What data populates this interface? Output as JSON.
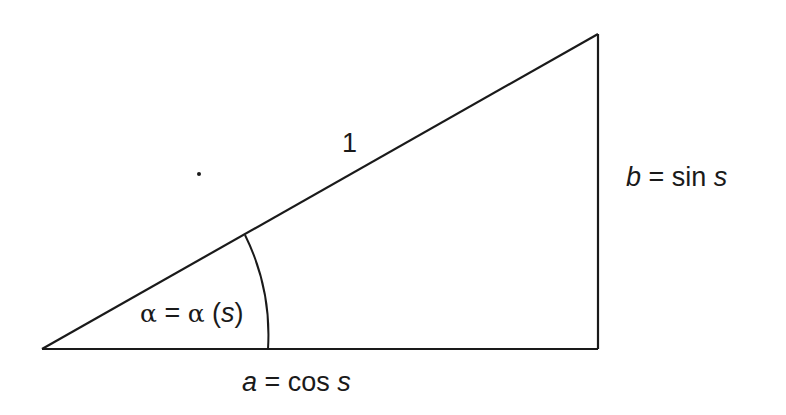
{
  "diagram": {
    "type": "right-triangle",
    "stroke_color": "#1a1a1a",
    "background": "#ffffff",
    "vertices": {
      "origin": [
        42,
        349
      ],
      "right_angle": [
        598,
        349
      ],
      "apex": [
        598,
        34
      ]
    },
    "angle_arc": {
      "center": [
        42,
        349
      ],
      "radius": 226
    },
    "dot": [
      199,
      174
    ],
    "labels": {
      "hypotenuse": {
        "text": "1"
      },
      "vertical": {
        "var": "b",
        "eq": " = sin ",
        "arg": "s"
      },
      "base": {
        "var": "a",
        "eq": " = cos ",
        "arg": "s"
      },
      "angle": {
        "sym1": "α",
        "eq": " = ",
        "sym2": "α",
        "open": " (",
        "arg": "s",
        "close": ")"
      }
    }
  }
}
